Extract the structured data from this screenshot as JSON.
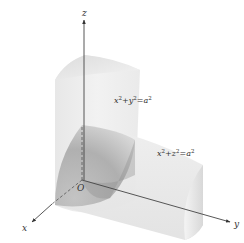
{
  "figure": {
    "axes": {
      "x_label": "x",
      "y_label": "y",
      "z_label": "z",
      "origin_label": "O"
    },
    "surfaces": [
      {
        "name": "vertical-cylinder",
        "equation_lhs_a": "x",
        "exp_a": "2",
        "plus": "+",
        "equation_lhs_b": "y",
        "exp_b": "2",
        "equals": "=",
        "rhs": "a",
        "exp_rhs": "2"
      },
      {
        "name": "horizontal-cylinder",
        "equation_lhs_a": "x",
        "exp_a": "2",
        "plus": "+",
        "equation_lhs_b": "z",
        "exp_b": "2",
        "equals": "=",
        "rhs": "a",
        "exp_rhs": "2"
      }
    ],
    "colors": {
      "axis": "#444444",
      "surface_light": "#ececec",
      "surface_mid": "#d4d4d4",
      "surface_dark": "#9a9a9a"
    }
  }
}
